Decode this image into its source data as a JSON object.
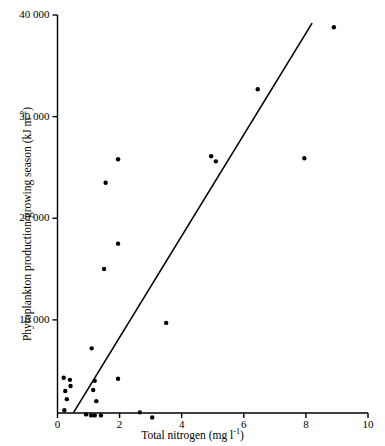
{
  "chart_data": {
    "type": "scatter",
    "title": "",
    "xlabel": "Total nitrogen (mg l⁻¹)",
    "ylabel": "Phytoplankton production/growing season (kJ m⁻²)",
    "xlabel_parts": {
      "base": "Total nitrogen (mg l",
      "sup": "-1",
      "tail": ")"
    },
    "ylabel_parts": {
      "base": "Phytoplankton production/growing season (kJ m",
      "sup": "-2",
      "tail": ")"
    },
    "xlim": [
      0,
      10
    ],
    "ylim": [
      0,
      40000
    ],
    "grid": false,
    "legend": null,
    "xticks": [
      0,
      2,
      4,
      6,
      8,
      10
    ],
    "xtick_labels": [
      "0",
      "2",
      "4",
      "6",
      "8",
      "10"
    ],
    "yticks": [
      10000,
      20000,
      30000,
      40000
    ],
    "ytick_labels": [
      "10 000",
      "20 000",
      "30 000",
      "40 000"
    ],
    "marker": {
      "shape": "circle",
      "color": "#000000",
      "size_px": 4.4
    },
    "points": [
      {
        "x": 0.2,
        "y": 4300
      },
      {
        "x": 0.4,
        "y": 4100
      },
      {
        "x": 0.42,
        "y": 3500
      },
      {
        "x": 0.25,
        "y": 3000
      },
      {
        "x": 0.3,
        "y": 2200
      },
      {
        "x": 0.22,
        "y": 1100
      },
      {
        "x": 1.2,
        "y": 4000
      },
      {
        "x": 1.15,
        "y": 3100
      },
      {
        "x": 1.25,
        "y": 2000
      },
      {
        "x": 0.92,
        "y": 700
      },
      {
        "x": 1.08,
        "y": 600
      },
      {
        "x": 1.2,
        "y": 600
      },
      {
        "x": 1.4,
        "y": 600
      },
      {
        "x": 1.95,
        "y": 4200
      },
      {
        "x": 1.1,
        "y": 7200
      },
      {
        "x": 2.65,
        "y": 900
      },
      {
        "x": 3.05,
        "y": 400
      },
      {
        "x": 1.5,
        "y": 15000
      },
      {
        "x": 1.95,
        "y": 17500
      },
      {
        "x": 1.55,
        "y": 23500
      },
      {
        "x": 1.95,
        "y": 25800
      },
      {
        "x": 3.5,
        "y": 9700
      },
      {
        "x": 4.95,
        "y": 26100
      },
      {
        "x": 5.1,
        "y": 25600
      },
      {
        "x": 6.45,
        "y": 32700
      },
      {
        "x": 7.95,
        "y": 25900
      },
      {
        "x": 8.9,
        "y": 38800
      }
    ],
    "fit_line": {
      "type": "linear",
      "x_start": 0.52,
      "y_start": 900,
      "x_end": 8.2,
      "y_end": 39200,
      "color": "#000000",
      "width_px": 1.6
    },
    "axis_color": "#000000",
    "background": "#ffffff"
  }
}
